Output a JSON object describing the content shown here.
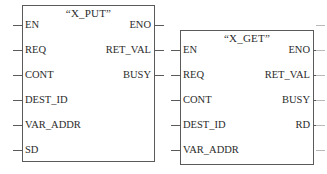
{
  "diagram": {
    "type": "function-block-diagram",
    "background_color": "#ffffff",
    "line_color": "#5a5a5a",
    "text_color": "#2b2b2b",
    "blocks": [
      {
        "id": "x_put",
        "title": "“X_PUT”",
        "name": "X_PUT",
        "x": 22,
        "y": 5,
        "width": 133,
        "height": 157,
        "title_y": 8,
        "inputs": [
          {
            "label": "EN",
            "y": 25
          },
          {
            "label": "REQ",
            "y": 50
          },
          {
            "label": "CONT",
            "y": 75
          },
          {
            "label": "DEST_ID",
            "y": 100
          },
          {
            "label": "VAR_ADDR",
            "y": 125
          },
          {
            "label": "SD",
            "y": 150
          }
        ],
        "outputs": [
          {
            "label": "ENO",
            "y": 25
          },
          {
            "label": "RET_VAL",
            "y": 50
          },
          {
            "label": "BUSY",
            "y": 75
          }
        ]
      },
      {
        "id": "x_get",
        "title": "“X_GET”",
        "name": "X_GET",
        "x": 180,
        "y": 30,
        "width": 134,
        "height": 135,
        "title_y": 33,
        "inputs": [
          {
            "label": "EN",
            "y": 50
          },
          {
            "label": "REQ",
            "y": 75
          },
          {
            "label": "CONT",
            "y": 100
          },
          {
            "label": "DEST_ID",
            "y": 125
          },
          {
            "label": "VAR_ADDR",
            "y": 150
          }
        ],
        "outputs": [
          {
            "label": "ENO",
            "y": 50
          },
          {
            "label": "RET_VAL",
            "y": 75
          },
          {
            "label": "BUSY",
            "y": 100
          },
          {
            "label": "RD",
            "y": 125
          }
        ]
      }
    ],
    "ghost_marks": [
      {
        "x": 316,
        "y": 25,
        "width": 9
      },
      {
        "x": 316,
        "y": 50,
        "width": 9
      },
      {
        "x": 316,
        "y": 75,
        "width": 9
      },
      {
        "x": 316,
        "y": 100,
        "width": 9
      },
      {
        "x": 316,
        "y": 125,
        "width": 9
      },
      {
        "x": 316,
        "y": 150,
        "width": 9
      }
    ]
  }
}
